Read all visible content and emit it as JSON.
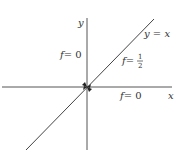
{
  "diagram": {
    "axes": {
      "x_label": "x",
      "y_label": "y"
    },
    "line_label": "y = x",
    "regions": [
      {
        "label_f": "f",
        "label_eq": "= 0",
        "position": "upper-left"
      },
      {
        "label_f": "f",
        "label_eq": "= ",
        "fraction_num": "1",
        "fraction_den": "2",
        "position": "on-diagonal"
      },
      {
        "label_f": "f",
        "label_eq": "= 0",
        "position": "lower-right"
      }
    ],
    "colors": {
      "axis": "#555555",
      "line": "#444444",
      "text": "#333333"
    }
  }
}
